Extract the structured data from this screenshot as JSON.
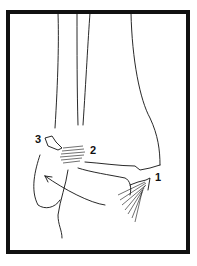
{
  "diagram": {
    "labels": [
      {
        "id": "1",
        "text": "1"
      },
      {
        "id": "2",
        "text": "2"
      },
      {
        "id": "3",
        "text": "3"
      }
    ],
    "colors": {
      "line": "#111111",
      "background": "#ffffff",
      "frame": "#111111"
    }
  }
}
